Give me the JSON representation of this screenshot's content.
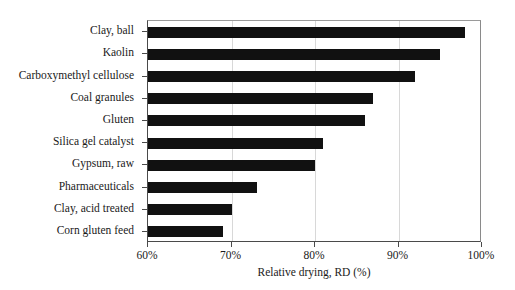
{
  "chart_data": {
    "type": "bar",
    "orientation": "horizontal",
    "title": "",
    "xlabel": "Relative drying, RD (%)",
    "ylabel": "",
    "xlim": [
      60,
      100
    ],
    "xticks": [
      60,
      70,
      80,
      90,
      100
    ],
    "xtick_labels": [
      "60%",
      "70%",
      "80%",
      "90%",
      "100%"
    ],
    "grid": "vertical",
    "legend": null,
    "bar_color": "#111111",
    "categories": [
      "Clay, ball",
      "Kaolin",
      "Carboxymethyl cellulose",
      "Coal granules",
      "Gluten",
      "Silica gel catalyst",
      "Gypsum, raw",
      "Pharmaceuticals",
      "Clay, acid treated",
      "Corn gluten feed"
    ],
    "values": [
      98,
      95,
      92,
      87,
      86,
      81,
      80,
      73,
      70,
      69
    ],
    "units": "%"
  }
}
